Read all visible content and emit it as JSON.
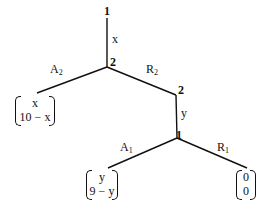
{
  "nodes": {
    "root": {
      "player": "1"
    },
    "n2": {
      "player": "2"
    },
    "n3": {
      "player": "2"
    },
    "n4": {
      "player": "1"
    }
  },
  "edges": {
    "root_to_n2": {
      "label": "x"
    },
    "n2_A": {
      "label": "A",
      "sub": "2"
    },
    "n2_R": {
      "label": "R",
      "sub": "2"
    },
    "n3_to_n4": {
      "label": "y"
    },
    "n4_A": {
      "label": "A",
      "sub": "1"
    },
    "n4_R": {
      "label": "R",
      "sub": "1"
    }
  },
  "payoffs": {
    "after_A2": {
      "top": "x",
      "bottom": "10 − x"
    },
    "after_A1": {
      "top": "y",
      "bottom": "9 − y"
    },
    "after_R1": {
      "top": "0",
      "bottom": "0"
    }
  },
  "colors": {
    "line": "#111111",
    "background": "#ffffff"
  }
}
